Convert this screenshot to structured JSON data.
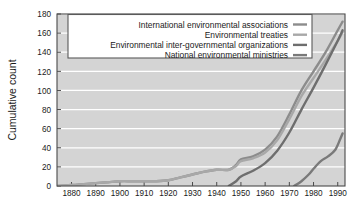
{
  "chart_data": {
    "type": "line",
    "title": "",
    "xlabel": "",
    "ylabel": "Cumulative count",
    "xlim": [
      1874,
      1993
    ],
    "ylim": [
      0,
      180
    ],
    "grid": true,
    "legend_position": "top-center",
    "xticks": [
      1880,
      1890,
      1900,
      1910,
      1920,
      1930,
      1940,
      1950,
      1960,
      1970,
      1980,
      1990
    ],
    "yticks": [
      0,
      20,
      40,
      60,
      80,
      100,
      120,
      140,
      160,
      180
    ],
    "xtick_labels": [
      "1880",
      "1890",
      "1900",
      "1910",
      "1920",
      "1930",
      "1940",
      "1950",
      "1960",
      "1970",
      "1980",
      "1990"
    ],
    "ytick_labels": [
      "0",
      "20",
      "40",
      "60",
      "80",
      "100",
      "120",
      "140",
      "160",
      "180"
    ],
    "series": [
      {
        "name": "International environmental associations",
        "color": "#8c8c8c",
        "x": [
          1874,
          1880,
          1885,
          1890,
          1895,
          1900,
          1905,
          1910,
          1915,
          1920,
          1925,
          1930,
          1935,
          1940,
          1945,
          1948,
          1950,
          1955,
          1960,
          1965,
          1970,
          1975,
          1980,
          1985,
          1990,
          1992
        ],
        "y": [
          0,
          1,
          2,
          3,
          4,
          5,
          5,
          5,
          5,
          6,
          9,
          12,
          15,
          17,
          17,
          22,
          28,
          31,
          38,
          52,
          75,
          100,
          120,
          140,
          163,
          172
        ]
      },
      {
        "name": "Environmental treaties",
        "color": "#a8a8a8",
        "x": [
          1874,
          1880,
          1885,
          1890,
          1895,
          1900,
          1905,
          1910,
          1915,
          1920,
          1925,
          1930,
          1935,
          1940,
          1945,
          1948,
          1950,
          1955,
          1960,
          1965,
          1970,
          1975,
          1980,
          1985,
          1990,
          1992
        ],
        "y": [
          0,
          1,
          2,
          3,
          4,
          5,
          5,
          5,
          5,
          6,
          9,
          12,
          15,
          17,
          17,
          21,
          26,
          29,
          35,
          48,
          70,
          94,
          113,
          132,
          152,
          161
        ]
      },
      {
        "name": "Environmental inter-governmental organizations",
        "color": "#6e6e6e",
        "x": [
          1945,
          1948,
          1950,
          1955,
          1960,
          1965,
          1970,
          1975,
          1980,
          1985,
          1990,
          1992
        ],
        "y": [
          0,
          5,
          10,
          16,
          24,
          37,
          56,
          80,
          103,
          127,
          152,
          163
        ]
      },
      {
        "name": "National environmental ministries",
        "color": "#7a7a7a",
        "x": [
          1972,
          1975,
          1978,
          1980,
          1983,
          1986,
          1989,
          1991,
          1992
        ],
        "y": [
          0,
          5,
          12,
          18,
          26,
          31,
          38,
          49,
          55
        ]
      }
    ]
  },
  "legend": {
    "entries": [
      {
        "label": "International environmental associations",
        "color": "#8c8c8c"
      },
      {
        "label": "Environmental treaties",
        "color": "#a8a8a8"
      },
      {
        "label": "Environmental inter-governmental organizations",
        "color": "#6e6e6e"
      },
      {
        "label": "National environmental ministries",
        "color": "#7a7a7a"
      }
    ]
  },
  "colors": {
    "plot_background": "#d4d4d4",
    "gridline": "#ffffff",
    "axis": "#4a4a4a",
    "text": "#1a1a1a",
    "legend_background": "#ffffff",
    "legend_border": "#5a5a5a"
  }
}
